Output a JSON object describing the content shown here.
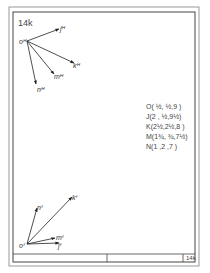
{
  "sheet": {
    "id_label": "14k",
    "title_block_id": "14k"
  },
  "points_list": [
    {
      "label": "O",
      "text": "O( ½, ½,9 )"
    },
    {
      "label": "J",
      "text": "J(2 , ½,9½)"
    },
    {
      "label": "K",
      "text": "K(2½,2½,8 )"
    },
    {
      "label": "M",
      "text": "M(1¾, ¾,7½)"
    },
    {
      "label": "N",
      "text": "N(1 ,2 ,7 )"
    }
  ],
  "horizontal_projection": {
    "origin_label": "oᴴ",
    "vectors": [
      {
        "label": "jᴴ"
      },
      {
        "label": "kᴴ"
      },
      {
        "label": "mᴴ"
      },
      {
        "label": "nᴴ"
      }
    ]
  },
  "frontal_projection": {
    "origin_label": "oᶠ",
    "vectors": [
      {
        "label": "nᶠ"
      },
      {
        "label": "kᶠ"
      },
      {
        "label": "mᶠ"
      },
      {
        "label": "jᶠ"
      }
    ]
  },
  "colors": {
    "ink": "#333333",
    "border": "#555555",
    "paper": "#ffffff"
  }
}
